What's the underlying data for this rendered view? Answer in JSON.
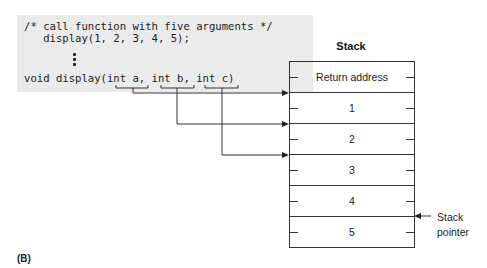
{
  "code": {
    "comment": "/* call function with five arguments */",
    "call": "   display(1, 2, 3, 4, 5);",
    "ellipsis": "vertical-dots",
    "signature": "void display(int a, int b, int c)",
    "params": [
      "int a",
      "int b",
      "int c"
    ]
  },
  "stack": {
    "title": "Stack",
    "rows": [
      "Return address",
      "1",
      "2",
      "3",
      "4",
      "5"
    ],
    "pointer_label_line1": "Stack",
    "pointer_label_line2": "pointer"
  },
  "figure_label": "(B)",
  "colors": {
    "code_background": "#ebebeb",
    "line": "#333333",
    "text": "#222222"
  }
}
